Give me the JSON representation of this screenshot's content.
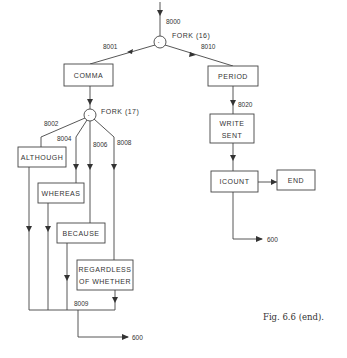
{
  "figure": {
    "caption": "Fig. 6.6 (end).",
    "entry_label": "8000",
    "forks": [
      {
        "id": "fork16",
        "label": "FORK (16)",
        "symbol": "·"
      },
      {
        "id": "fork17",
        "label": "FORK (17)",
        "symbol": "·"
      }
    ],
    "edge_labels": {
      "e8001": "8001",
      "e8010": "8010",
      "e8002": "8002",
      "e8004": "8004",
      "e8006": "8006",
      "e8008": "8008",
      "e8009": "8009",
      "e8020": "8020"
    },
    "boxes": {
      "comma": "COMMA",
      "period": "PERIOD",
      "although": "ALTHOUGH",
      "whereas": "WHEREAS",
      "because": "BECAUSE",
      "regardless_line1": "REGARDLESS",
      "regardless_line2": "OF WHETHER",
      "write_line1": "WRITE",
      "write_line2": "SENT",
      "icount": "ICOUNT",
      "end": "END"
    },
    "exits": {
      "left": "600",
      "right": "600"
    }
  }
}
